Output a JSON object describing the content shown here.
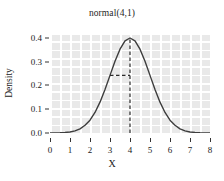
{
  "chart_data": {
    "type": "line",
    "title": "normal(4,1)",
    "xlabel": "X",
    "ylabel": "Density",
    "xlim": [
      0,
      8
    ],
    "ylim": [
      0,
      0.42
    ],
    "xticks": [
      0,
      1,
      2,
      3,
      4,
      5,
      6,
      7,
      8
    ],
    "xtick_labels": [
      "0",
      "1",
      "2",
      "3",
      "4",
      "5",
      "6",
      "7",
      "8"
    ],
    "yticks": [
      0.0,
      0.1,
      0.2,
      0.3,
      0.4
    ],
    "ytick_labels": [
      "0.0",
      "0.1",
      "0.2",
      "0.3",
      "0.4"
    ],
    "grid": true,
    "legend": null,
    "distribution": {
      "family": "normal",
      "mean": 4,
      "sd": 1
    },
    "series": [
      {
        "name": "normal(4,1) density",
        "color": "#3d3d3d",
        "x": [
          0,
          0.25,
          0.5,
          0.75,
          1,
          1.25,
          1.5,
          1.75,
          2,
          2.25,
          2.5,
          2.75,
          3,
          3.25,
          3.5,
          3.75,
          4,
          4.25,
          4.5,
          4.75,
          5,
          5.25,
          5.5,
          5.75,
          6,
          6.25,
          6.5,
          6.75,
          7,
          7.25,
          7.5,
          7.75,
          8
        ],
        "y": [
          0.0001,
          0.0004,
          0.0009,
          0.0022,
          0.0044,
          0.0088,
          0.0175,
          0.0325,
          0.054,
          0.0863,
          0.1295,
          0.1826,
          0.242,
          0.3011,
          0.3521,
          0.3867,
          0.3989,
          0.3867,
          0.3521,
          0.3011,
          0.242,
          0.1826,
          0.1295,
          0.0863,
          0.054,
          0.0325,
          0.0175,
          0.0088,
          0.0044,
          0.0022,
          0.0009,
          0.0004,
          0.0001
        ]
      }
    ],
    "annotations": [
      {
        "name": "mean-vertical-line",
        "style": "dashed",
        "x": 4,
        "y_from": 0,
        "y_to": 0.3989
      },
      {
        "name": "sd-horizontal-line",
        "style": "dashed",
        "y": 0.242,
        "x_from": 3,
        "x_to": 4
      }
    ]
  }
}
